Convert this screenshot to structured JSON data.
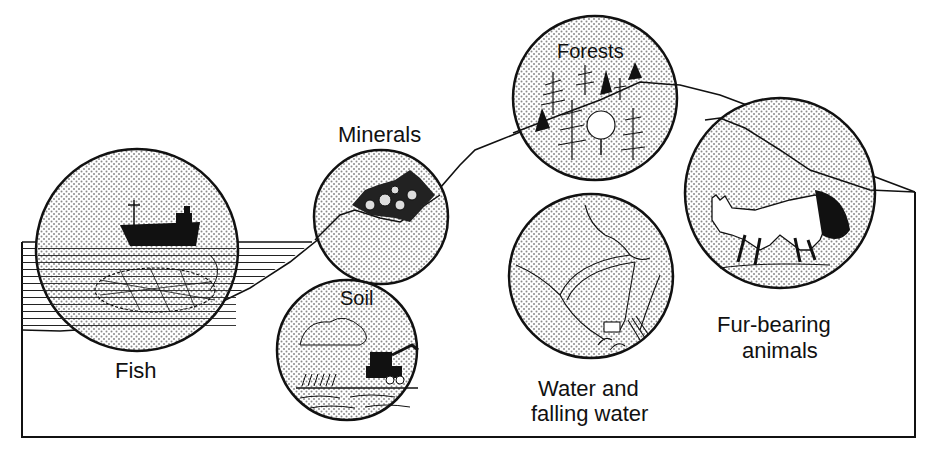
{
  "diagram": {
    "resources": [
      {
        "id": "fish",
        "label": "Fish"
      },
      {
        "id": "minerals",
        "label": "Minerals"
      },
      {
        "id": "soil",
        "label": "Soil"
      },
      {
        "id": "forests",
        "label": "Forests"
      },
      {
        "id": "water",
        "label_line1": "Water and",
        "label_line2": "falling water"
      },
      {
        "id": "fur",
        "label_line1": "Fur-bearing",
        "label_line2": "animals"
      }
    ],
    "colors": {
      "ink": "#111111",
      "background": "#ffffff",
      "dots": "#8a8a8a"
    }
  }
}
